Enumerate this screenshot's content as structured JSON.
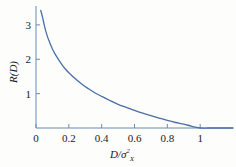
{
  "chart_data": {
    "type": "line",
    "title": "",
    "subtitle": "",
    "xlabel": "D/σ²ₓ",
    "xlabel_parts": {
      "numerator": "D",
      "slash": "/",
      "denominator_base": "σ",
      "denominator_sup": "2",
      "denominator_sub": "X"
    },
    "ylabel": "R(D)",
    "xlim": [
      0,
      1.2
    ],
    "ylim": [
      0,
      3.55
    ],
    "grid": false,
    "legend": null,
    "series": [
      {
        "name": "R(D) = -½ ln(D/σ²ₓ)",
        "color": "#4a6fa5",
        "x": [
          0.029,
          0.04,
          0.05,
          0.06,
          0.07,
          0.08,
          0.09,
          0.1,
          0.12,
          0.14,
          0.16,
          0.18,
          0.2,
          0.24,
          0.28,
          0.32,
          0.36,
          0.4,
          0.45,
          0.5,
          0.55,
          0.6,
          0.65,
          0.7,
          0.75,
          0.8,
          0.85,
          0.9,
          0.95,
          1.0,
          1.05,
          1.1,
          1.15,
          1.2
        ],
        "y": [
          3.42,
          3.22,
          3.0,
          2.81,
          2.66,
          2.53,
          2.41,
          2.3,
          2.12,
          1.97,
          1.83,
          1.71,
          1.61,
          1.43,
          1.27,
          1.14,
          1.02,
          0.92,
          0.8,
          0.69,
          0.6,
          0.51,
          0.43,
          0.36,
          0.29,
          0.22,
          0.16,
          0.11,
          0.05,
          0.0,
          0.0,
          0.0,
          0.0,
          0.0
        ]
      }
    ],
    "xticks": [
      {
        "value": 0,
        "label": "0"
      },
      {
        "value": 0.2,
        "label": "0.2"
      },
      {
        "value": 0.4,
        "label": "0.4"
      },
      {
        "value": 0.6,
        "label": "0.6"
      },
      {
        "value": 0.8,
        "label": "0.8"
      },
      {
        "value": 1.0,
        "label": "1"
      }
    ],
    "yticks": [
      {
        "value": 1,
        "label": "1"
      },
      {
        "value": 2,
        "label": "2"
      },
      {
        "value": 3,
        "label": "3"
      }
    ],
    "axis_color": "#6b8cb8",
    "background": "#fdfdfc"
  }
}
